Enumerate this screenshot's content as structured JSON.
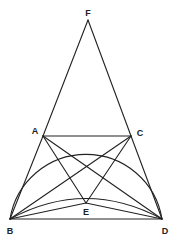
{
  "diagram": {
    "type": "geometry",
    "stroke_color": "#222222",
    "points": {
      "F": {
        "label": "F",
        "x": 88,
        "y": 20,
        "lx": 88,
        "ly": 16
      },
      "A": {
        "label": "A",
        "x": 43,
        "y": 136,
        "lx": 35,
        "ly": 134
      },
      "C": {
        "label": "C",
        "x": 131,
        "y": 136,
        "lx": 140,
        "ly": 136
      },
      "B": {
        "label": "B",
        "x": 10,
        "y": 219,
        "lx": 10,
        "ly": 234
      },
      "D": {
        "label": "D",
        "x": 162,
        "y": 219,
        "lx": 165,
        "ly": 234
      },
      "E": {
        "label": "E",
        "x": 86,
        "y": 203,
        "lx": 86,
        "ly": 215
      }
    },
    "segments": [
      "FA",
      "FC",
      "AC",
      "BD",
      "AB",
      "CD",
      "AD",
      "BC",
      "AE",
      "CE",
      "BE",
      "DE"
    ],
    "arcs": [
      "outer circle arc B-A-C-D",
      "inner arc B-D through near E"
    ]
  }
}
